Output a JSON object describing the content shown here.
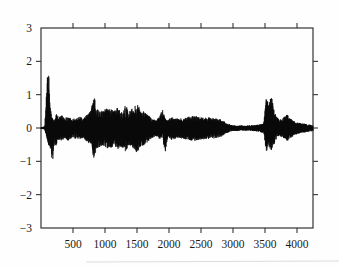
{
  "chart_data": {
    "type": "line",
    "title": "",
    "subtitle": "",
    "xlabel": "",
    "ylabel": "",
    "xlim": [
      0,
      4250
    ],
    "ylim": [
      -3,
      3
    ],
    "grid": false,
    "legend": null,
    "x_ticks": [
      500,
      1000,
      1500,
      2000,
      2500,
      3000,
      3500,
      4000
    ],
    "x_tick_labels": [
      "500",
      "1000",
      "1500",
      "2000",
      "2500",
      "3000",
      "3500",
      "4000"
    ],
    "y_ticks": [
      3,
      2,
      1,
      0,
      -1,
      -2,
      -3
    ],
    "y_tick_labels": [
      "3",
      "2",
      "1",
      "0",
      "−1",
      "−2",
      "−3"
    ],
    "y_ticks_with_marks": [
      2,
      1,
      0,
      -1,
      -2
    ],
    "top_axis_ticks": [
      500,
      1000,
      1500,
      2000,
      2500,
      3000,
      3500,
      4000
    ],
    "right_axis_ticks": [
      2,
      1,
      0,
      -1,
      -2
    ],
    "series": [
      {
        "name": "signal",
        "color": "#0a0a0a",
        "description": "High-frequency oscillatory trace (seismogram-like) with strong early transient, sustained mid-record coda, quiet interval, and late burst",
        "envelope_x": [
          0,
          60,
          110,
          150,
          180,
          210,
          240,
          280,
          320,
          360,
          420,
          480,
          540,
          600,
          660,
          720,
          780,
          840,
          860,
          900,
          960,
          1020,
          1080,
          1140,
          1200,
          1260,
          1320,
          1380,
          1440,
          1500,
          1560,
          1620,
          1680,
          1740,
          1800,
          1860,
          1900,
          1940,
          1980,
          2040,
          2100,
          2160,
          2220,
          2300,
          2400,
          2500,
          2600,
          2700,
          2800,
          2860,
          2900,
          2960,
          3000,
          3100,
          3200,
          3300,
          3400,
          3480,
          3520,
          3560,
          3600,
          3640,
          3680,
          3720,
          3780,
          3840,
          3900,
          3960,
          4020,
          4080,
          4140,
          4200,
          4250
        ],
        "envelope_pos": [
          0.02,
          0.05,
          2.0,
          0.55,
          0.3,
          0.22,
          0.45,
          0.3,
          0.4,
          0.3,
          0.35,
          0.28,
          0.3,
          0.34,
          0.3,
          0.4,
          0.55,
          1.0,
          0.6,
          0.55,
          0.52,
          0.58,
          0.6,
          0.5,
          0.62,
          0.55,
          0.68,
          0.52,
          0.6,
          0.72,
          0.55,
          0.48,
          0.38,
          0.28,
          0.22,
          0.4,
          0.55,
          0.3,
          0.22,
          0.34,
          0.3,
          0.28,
          0.3,
          0.34,
          0.36,
          0.34,
          0.32,
          0.3,
          0.26,
          0.2,
          0.14,
          0.1,
          0.08,
          0.07,
          0.07,
          0.08,
          0.1,
          0.14,
          0.9,
          0.7,
          1.0,
          0.55,
          0.35,
          0.25,
          0.3,
          0.42,
          0.28,
          0.2,
          0.16,
          0.14,
          0.12,
          0.1,
          0.08
        ],
        "envelope_neg": [
          0.02,
          0.05,
          0.5,
          0.7,
          1.05,
          0.45,
          0.55,
          0.35,
          0.4,
          0.32,
          0.38,
          0.3,
          0.32,
          0.36,
          0.34,
          0.42,
          0.5,
          1.08,
          0.62,
          0.58,
          0.55,
          0.6,
          0.62,
          0.52,
          0.64,
          0.58,
          0.7,
          0.55,
          0.62,
          0.74,
          0.58,
          0.5,
          0.4,
          0.3,
          0.24,
          0.35,
          0.3,
          0.8,
          0.25,
          0.36,
          0.32,
          0.3,
          0.32,
          0.36,
          0.38,
          0.36,
          0.34,
          0.32,
          0.28,
          0.22,
          0.15,
          0.11,
          0.09,
          0.08,
          0.08,
          0.09,
          0.11,
          0.15,
          0.72,
          0.6,
          0.68,
          0.5,
          0.33,
          0.24,
          0.28,
          0.4,
          0.3,
          0.22,
          0.17,
          0.15,
          0.13,
          0.11,
          0.09
        ],
        "peak_max": 2.0,
        "peak_max_x": 110,
        "peak_min": -1.08,
        "peak_min_x": 868,
        "n_points": 4250
      }
    ],
    "annotations": []
  },
  "figure": {
    "frame_color": "#2b2b2b",
    "background": "#fefefe",
    "trace_color": "#0a0a0a"
  }
}
